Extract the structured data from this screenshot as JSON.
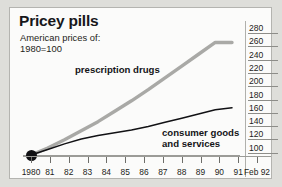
{
  "header": {
    "title": "Pricey pills",
    "subtitle_line1": "American prices of:",
    "subtitle_line2": "1980=100"
  },
  "series_labels": {
    "drugs": "prescription drugs",
    "consumer_line1": "consumer goods",
    "consumer_line2": "and services"
  },
  "colors": {
    "drugs_line": "#a9a9a6",
    "consumer_line": "#111114",
    "panel_background": "#fbfbfa",
    "page_background": "#dededa",
    "axis": "#9b9b97",
    "text": "#17171a"
  },
  "chart_data": {
    "type": "line",
    "title": "Pricey pills",
    "subtitle": "American prices of: 1980=100",
    "xlabel": "",
    "ylabel": "",
    "ylim": [
      100,
      290
    ],
    "yticks": [
      280,
      260,
      240,
      220,
      200,
      180,
      160,
      140,
      120,
      100
    ],
    "grid": false,
    "legend": "inline-annotations",
    "categories": [
      "1980",
      "81",
      "82",
      "83",
      "84",
      "85",
      "86",
      "87",
      "88",
      "89",
      "90",
      "91",
      "Feb 92"
    ],
    "series": [
      {
        "name": "prescription drugs",
        "color": "#a9a9a6",
        "values": [
          100,
          110,
          122,
          135,
          148,
          163,
          178,
          194,
          211,
          228,
          245,
          262,
          262
        ]
      },
      {
        "name": "consumer goods and services",
        "color": "#111114",
        "values": [
          100,
          108,
          116,
          123,
          128,
          132,
          136,
          141,
          147,
          153,
          159,
          165,
          168
        ]
      }
    ],
    "annotations": [
      {
        "text": "1980=100 base point",
        "x": "1980",
        "y": 100,
        "marker": "filled-dot"
      }
    ]
  },
  "axes": {
    "y_labels": [
      "280",
      "260",
      "240",
      "220",
      "200",
      "180",
      "160",
      "140",
      "120",
      "100"
    ],
    "x_labels": [
      "1980",
      "81",
      "82",
      "83",
      "84",
      "85",
      "86",
      "87",
      "88",
      "89",
      "90",
      "91",
      "Feb 92"
    ]
  }
}
